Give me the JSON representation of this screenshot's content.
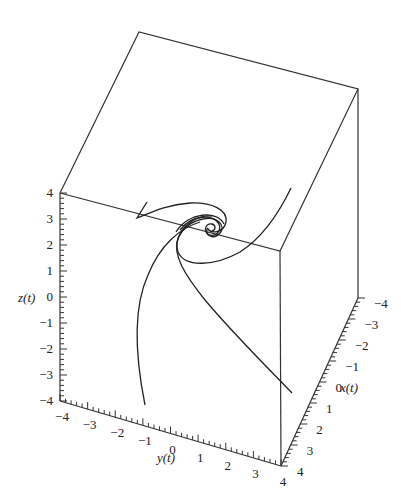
{
  "chart_data": {
    "type": "line3d",
    "title": "",
    "axes": {
      "x": {
        "label": "x(t)",
        "range": [
          -4,
          4
        ],
        "ticks": [
          "-4",
          "-3",
          "-2",
          "-1",
          "0",
          "1",
          "2",
          "3",
          "4"
        ]
      },
      "y": {
        "label": "y(t)",
        "range": [
          -4,
          4
        ],
        "ticks": [
          "-4",
          "-3",
          "-2",
          "-1",
          "0",
          "1",
          "2",
          "3",
          "4"
        ]
      },
      "z": {
        "label": "z(t)",
        "range": [
          -4,
          4
        ],
        "ticks": [
          "4",
          "3",
          "2",
          "1",
          "0",
          "-1",
          "-2",
          "-3",
          "-4"
        ]
      }
    },
    "series": [
      {
        "name": "trajectory-1",
        "note": "from lower-left (y≈-1, z≈-4) rising and spiraling into origin"
      },
      {
        "name": "trajectory-2",
        "note": "from lower-right (x≈0, z≈-3) curving up into origin spiral"
      },
      {
        "name": "trajectory-3",
        "note": "from top-left (y≈-4, z≈3) sweeping across into spiral"
      },
      {
        "name": "trajectory-4",
        "note": "from top-right (z≈4) sweeping down into spiral"
      }
    ],
    "grid": false,
    "legend": null
  },
  "labels": {
    "x_axis": "x(t)",
    "y_axis": "y(t)",
    "z_axis": "z(t)"
  }
}
